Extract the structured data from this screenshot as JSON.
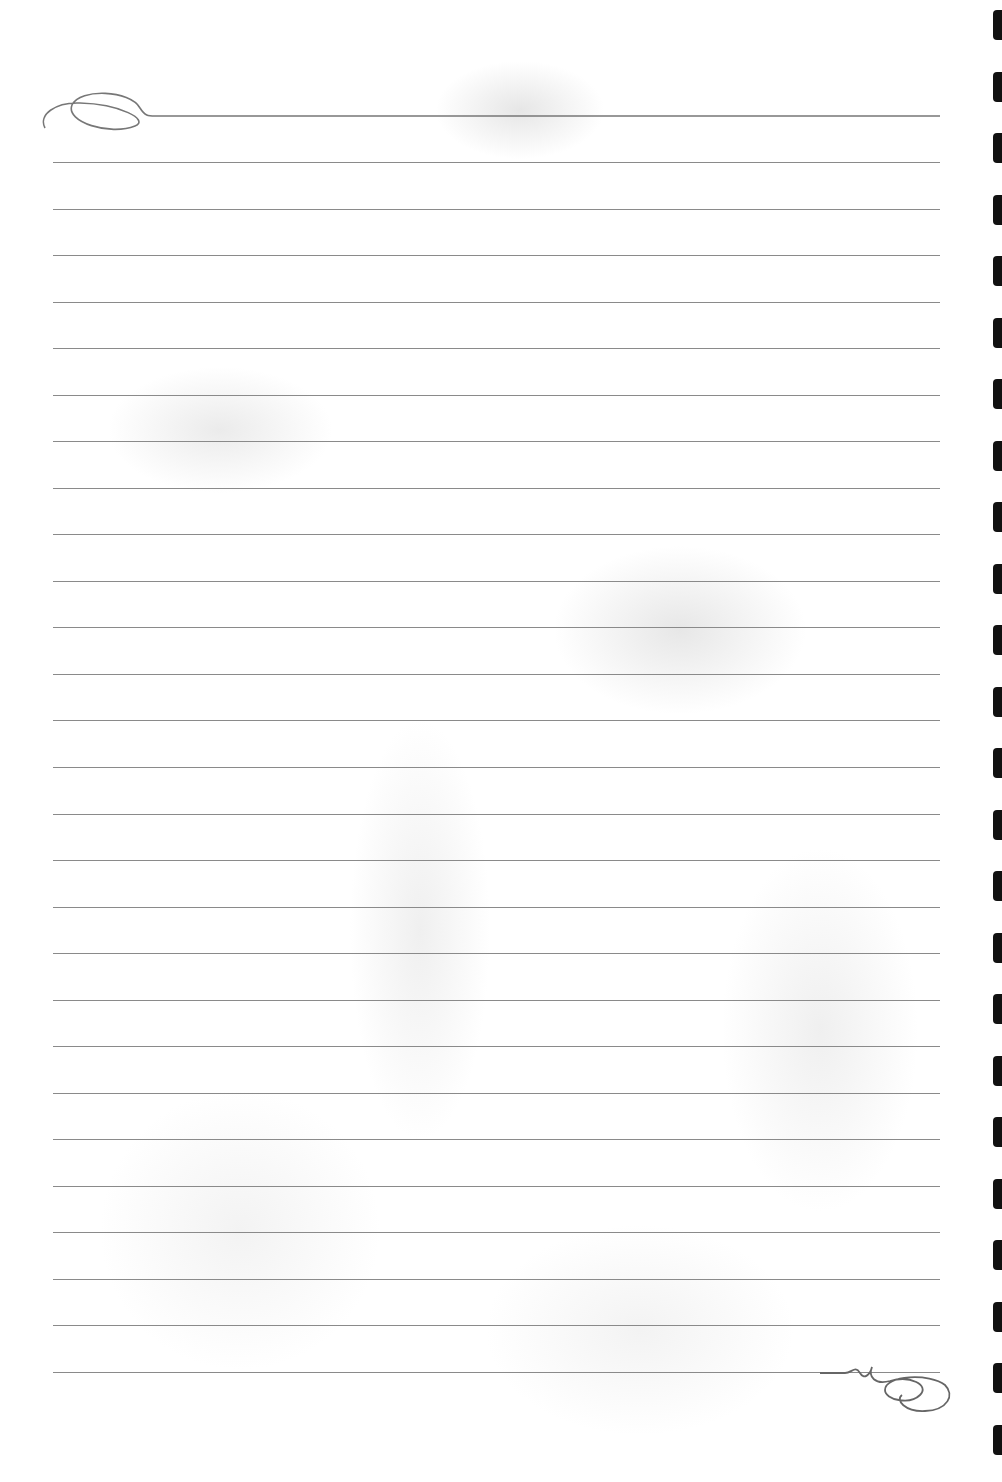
{
  "document": {
    "type": "lined-notebook-page",
    "background": "faded floral watermark",
    "line_color": "#8a8a8a",
    "ruled_lines": {
      "top_ornament_line_y": 116,
      "first_line_y": 162,
      "last_line_y": 1372,
      "count": 27,
      "left_x": 53,
      "right_x": 940
    },
    "binding_holes": {
      "count": 24,
      "side": "right",
      "color": "#111111"
    },
    "ornaments": [
      "top-left-flourish-icon",
      "bottom-right-flourish-icon"
    ]
  }
}
